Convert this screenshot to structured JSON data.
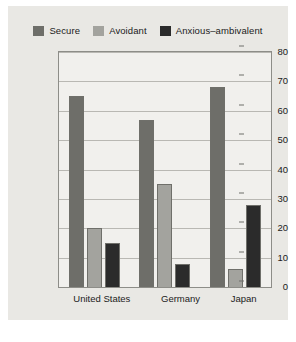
{
  "chart_data": {
    "type": "bar",
    "title": "",
    "xlabel": "",
    "ylabel": "Percentage of Infants",
    "categories": [
      "United States",
      "Germany",
      "Japan"
    ],
    "series": [
      {
        "name": "Secure",
        "color": "#6e6e69",
        "values": [
          65,
          57,
          68
        ]
      },
      {
        "name": "Avoidant",
        "color": "#a3a39e",
        "values": [
          20,
          35,
          6
        ]
      },
      {
        "name": "Anxious–ambivalent",
        "color": "#2b2b2b",
        "values": [
          15,
          8,
          28
        ]
      }
    ],
    "ylim": [
      0,
      80
    ],
    "yticks": [
      0,
      10,
      20,
      30,
      40,
      50,
      60,
      70,
      80
    ],
    "grid": true,
    "legend_position": "top"
  },
  "figure": {
    "background_color": "#e9e8e4",
    "plot_background_color": "#f1f0ed",
    "axis_color": "#8d8d88"
  }
}
